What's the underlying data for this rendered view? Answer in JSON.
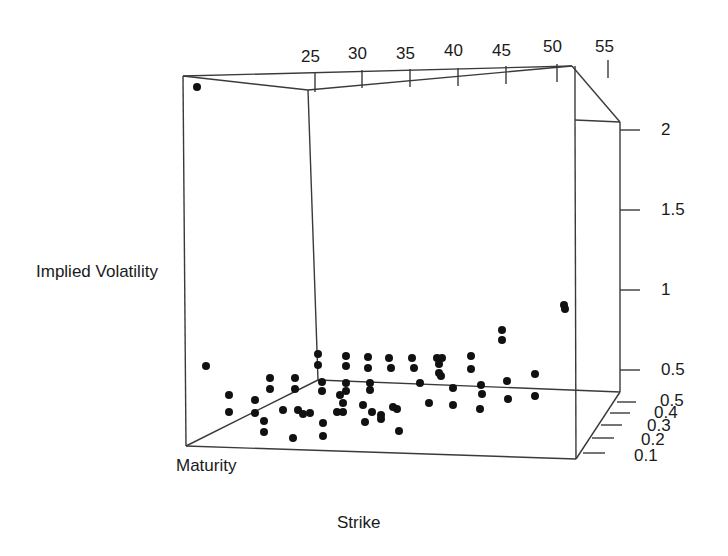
{
  "chart_data": {
    "type": "scatter",
    "subtype": "3d-scatter",
    "title": "",
    "xlabel": "Strike",
    "ylabel": "Maturity",
    "zlabel": "Implied Volatility",
    "x_ticks": [
      "25",
      "30",
      "35",
      "40",
      "45",
      "50",
      "55"
    ],
    "y_ticks": [
      "0.1",
      "0.2",
      "0.3",
      "0.4",
      "0.5"
    ],
    "z_ticks": [
      "0.5",
      "1",
      "1.5",
      "2"
    ],
    "xlim": [
      22,
      55
    ],
    "ylim": [
      0.05,
      0.5
    ],
    "zlim": [
      0.3,
      2.3
    ],
    "grid": false,
    "points_px": [
      [
        197,
        87
      ],
      [
        206,
        366
      ],
      [
        229,
        395
      ],
      [
        229,
        412
      ],
      [
        255,
        400
      ],
      [
        255,
        413
      ],
      [
        264,
        421
      ],
      [
        264,
        432
      ],
      [
        270,
        378
      ],
      [
        270,
        389
      ],
      [
        283,
        410
      ],
      [
        293,
        438
      ],
      [
        295,
        378
      ],
      [
        295,
        389
      ],
      [
        298,
        410
      ],
      [
        303,
        414
      ],
      [
        310,
        413
      ],
      [
        318,
        354
      ],
      [
        318,
        365
      ],
      [
        322,
        382
      ],
      [
        322,
        391
      ],
      [
        323,
        423
      ],
      [
        323,
        436
      ],
      [
        337,
        412
      ],
      [
        340,
        395
      ],
      [
        343,
        403
      ],
      [
        343,
        412
      ],
      [
        346,
        383
      ],
      [
        346,
        391
      ],
      [
        346,
        356
      ],
      [
        346,
        366
      ],
      [
        363,
        405
      ],
      [
        365,
        422
      ],
      [
        368,
        357
      ],
      [
        368,
        368
      ],
      [
        370,
        383
      ],
      [
        370,
        390
      ],
      [
        372,
        412
      ],
      [
        381,
        415
      ],
      [
        381,
        419
      ],
      [
        389,
        358
      ],
      [
        391,
        368
      ],
      [
        393,
        407
      ],
      [
        397,
        409
      ],
      [
        399,
        431
      ],
      [
        412,
        358
      ],
      [
        414,
        368
      ],
      [
        420,
        383
      ],
      [
        429,
        403
      ],
      [
        437,
        358
      ],
      [
        439,
        364
      ],
      [
        439,
        373
      ],
      [
        441,
        376
      ],
      [
        442,
        358
      ],
      [
        453,
        405
      ],
      [
        453,
        388
      ],
      [
        471,
        356
      ],
      [
        471,
        369
      ],
      [
        480,
        409
      ],
      [
        481,
        385
      ],
      [
        482,
        394
      ],
      [
        502,
        330
      ],
      [
        502,
        340
      ],
      [
        507,
        381
      ],
      [
        508,
        399
      ],
      [
        535,
        374
      ],
      [
        535,
        396
      ],
      [
        564,
        305
      ],
      [
        565,
        309
      ]
    ]
  },
  "axes": {
    "x_label": "Strike",
    "y_label": "Maturity",
    "z_label": "Implied Volatility"
  }
}
